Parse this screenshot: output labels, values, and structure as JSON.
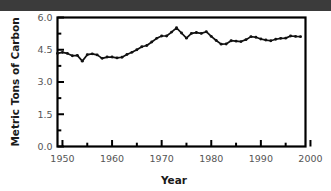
{
  "figure": {
    "background_color": "#ffffff",
    "top_band_color": "#3b3b3b",
    "frame_color": "#000000",
    "series_color": "#111111"
  },
  "chart_data": {
    "type": "line",
    "title": "",
    "xlabel": "Year",
    "ylabel": "Metric Tons of Carbon",
    "xlim": [
      1949,
      1999
    ],
    "ylim": [
      0.0,
      6.0
    ],
    "xticks": [
      1950,
      1960,
      1970,
      1980,
      1990,
      2000
    ],
    "xtick_labels": [
      "1950",
      "1960",
      "1970",
      "1980",
      "1990",
      "2000"
    ],
    "xminor_ticks": [
      1955,
      1965,
      1975,
      1985,
      1995
    ],
    "yticks": [
      0.0,
      1.5,
      3.0,
      4.5,
      6.0
    ],
    "ytick_labels": [
      "0.0",
      "1.5",
      "3.0",
      "4.5",
      "6.0"
    ],
    "yminor_ticks": [
      0.75,
      2.25,
      3.75,
      5.25
    ],
    "grid": false,
    "legend": null,
    "markers": "filled-circle",
    "x": [
      1949,
      1950,
      1951,
      1952,
      1953,
      1954,
      1955,
      1956,
      1957,
      1958,
      1959,
      1960,
      1961,
      1962,
      1963,
      1964,
      1965,
      1966,
      1967,
      1968,
      1969,
      1970,
      1971,
      1972,
      1973,
      1974,
      1975,
      1976,
      1977,
      1978,
      1979,
      1980,
      1981,
      1982,
      1983,
      1984,
      1985,
      1986,
      1987,
      1988,
      1989,
      1990,
      1991,
      1992,
      1993,
      1994,
      1995,
      1996,
      1997,
      1998
    ],
    "values": [
      4.33,
      4.38,
      4.33,
      4.22,
      4.24,
      3.97,
      4.27,
      4.31,
      4.26,
      4.1,
      4.16,
      4.16,
      4.12,
      4.15,
      4.28,
      4.38,
      4.5,
      4.64,
      4.7,
      4.86,
      5.03,
      5.14,
      5.14,
      5.32,
      5.52,
      5.28,
      5.04,
      5.26,
      5.3,
      5.26,
      5.34,
      5.12,
      4.93,
      4.76,
      4.77,
      4.92,
      4.9,
      4.88,
      4.97,
      5.11,
      5.08,
      5.0,
      4.95,
      4.92,
      4.99,
      5.03,
      5.04,
      5.14,
      5.12,
      5.11
    ]
  },
  "axis_titles": {
    "x": "Year",
    "y": "Metric Tons of Carbon"
  }
}
